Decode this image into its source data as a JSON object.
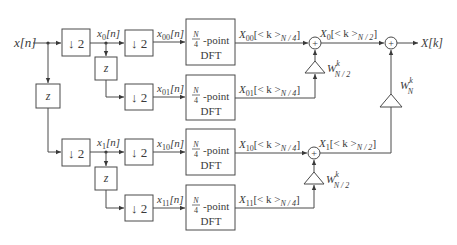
{
  "diagram": {
    "input": {
      "label": "x[n]"
    },
    "output": {
      "label": "X[k]"
    },
    "delay_label": "z",
    "decimator_label": "↓ 2",
    "stage1": {
      "upper_signal": {
        "base": "x",
        "sub": "0",
        "tail": "[n]"
      },
      "lower_signal": {
        "base": "x",
        "sub": "1",
        "tail": "[n]"
      }
    },
    "stage2": {
      "signals": [
        {
          "base": "x",
          "sub": "00",
          "tail": "[n]"
        },
        {
          "base": "x",
          "sub": "01",
          "tail": "[n]"
        },
        {
          "base": "x",
          "sub": "10",
          "tail": "[n]"
        },
        {
          "base": "x",
          "sub": "11",
          "tail": "[n]"
        }
      ]
    },
    "dft_block": {
      "num": "N",
      "den": "4",
      "suffix": "-point",
      "line2": "DFT"
    },
    "dft_outputs": [
      {
        "base": "X",
        "sub": "00",
        "mid": "[< k >",
        "msub": "N / 4",
        "tail": "]"
      },
      {
        "base": "X",
        "sub": "01",
        "mid": "[< k >",
        "msub": "N / 4",
        "tail": "]"
      },
      {
        "base": "X",
        "sub": "10",
        "mid": "[< k >",
        "msub": "N / 4",
        "tail": "]"
      },
      {
        "base": "X",
        "sub": "11",
        "mid": "[< k >",
        "msub": "N / 4",
        "tail": "]"
      }
    ],
    "combined_outputs": [
      {
        "base": "X",
        "sub": "0",
        "mid": "[< k >",
        "msub": "N / 2",
        "tail": "]"
      },
      {
        "base": "X",
        "sub": "1",
        "mid": "[< k >",
        "msub": "N / 2",
        "tail": "]"
      }
    ],
    "twiddles": [
      {
        "base": "W",
        "sup": "k",
        "sub": "N / 2"
      },
      {
        "base": "W",
        "sup": "k",
        "sub": "N"
      },
      {
        "base": "W",
        "sup": "k",
        "sub": "N / 2"
      }
    ],
    "adder_symbol": "+"
  }
}
